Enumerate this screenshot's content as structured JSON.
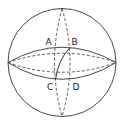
{
  "diagram": {
    "type": "sphere-with-great-circles",
    "colors": {
      "stroke": "#333333",
      "background": "#ffffff"
    },
    "sphere": {
      "cx": 62,
      "cy": 62.5,
      "r": 54
    },
    "labels": {
      "A": "A",
      "B": "B",
      "C": "C",
      "D": "D"
    },
    "points": {
      "A": {
        "x": 55,
        "y": 47
      },
      "B": {
        "x": 70,
        "y": 47
      },
      "C": {
        "x": 55,
        "y": 80
      },
      "D": {
        "x": 70,
        "y": 80
      }
    },
    "arc": {
      "from": "B",
      "to": "C",
      "style": "solid"
    }
  }
}
